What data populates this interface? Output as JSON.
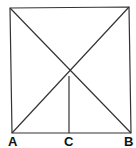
{
  "diagram": {
    "type": "geometry",
    "colors": {
      "stroke": "#333333",
      "label": "#111111",
      "background": "#ffffff"
    },
    "points": {
      "top_left": [
        10,
        8
      ],
      "top_right": [
        129,
        7
      ],
      "A": [
        12,
        133
      ],
      "B": [
        131,
        133
      ],
      "intersection": [
        69,
        71
      ],
      "C_top": [
        69,
        76
      ],
      "C": [
        69,
        133
      ]
    },
    "labels": [
      {
        "id": "A",
        "text": "A",
        "x": 8,
        "y": 146
      },
      {
        "id": "C",
        "text": "C",
        "x": 64,
        "y": 146
      },
      {
        "id": "B",
        "text": "B",
        "x": 124,
        "y": 146
      }
    ]
  }
}
